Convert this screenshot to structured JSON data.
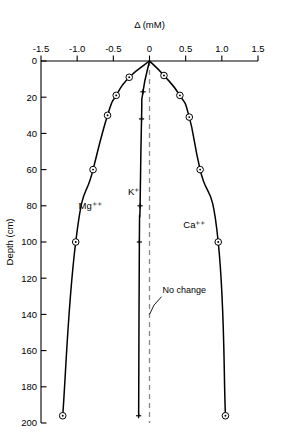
{
  "chart_data": {
    "type": "line",
    "title": "",
    "xlabel": "Δ (mM)",
    "ylabel": "Depth (cm)",
    "xlim": [
      -1.5,
      1.5
    ],
    "ylim": [
      0,
      200
    ],
    "y_inverted": true,
    "grid": false,
    "legend_position": "inline-annotations",
    "x_ticks": [
      -1.5,
      -1.0,
      -0.5,
      0,
      0.5,
      1.0,
      1.5
    ],
    "x_tick_labels": [
      "-1.5",
      "-1.0",
      "-0.5",
      "0",
      "0.5",
      "1.0",
      "1.5"
    ],
    "y_ticks": [
      0,
      20,
      40,
      60,
      80,
      100,
      120,
      140,
      160,
      180,
      200
    ],
    "y_tick_labels": [
      "0",
      "20",
      "40",
      "60",
      "80",
      "100",
      "120",
      "140",
      "160",
      "180",
      "200"
    ],
    "annotations": [
      {
        "text": "No change",
        "x": 0.18,
        "y": 128,
        "points_to_x": 0.0,
        "points_to_y": 140
      }
    ],
    "reference_line": {
      "name": "no-change-line",
      "x": 0,
      "style": "dashed",
      "color": "#888888"
    },
    "series": [
      {
        "name": "Mg++",
        "label": "Mg⁺⁺",
        "marker": "circle-dot",
        "color": "#000000",
        "label_x": -0.82,
        "label_y": 82,
        "points": [
          {
            "x": 0.0,
            "y": 0
          },
          {
            "x": -0.28,
            "y": 9
          },
          {
            "x": -0.46,
            "y": 19
          },
          {
            "x": -0.58,
            "y": 30
          },
          {
            "x": -0.78,
            "y": 60
          },
          {
            "x": -1.02,
            "y": 100
          },
          {
            "x": -1.2,
            "y": 196
          }
        ]
      },
      {
        "name": "K+",
        "label": "K⁺",
        "marker": "plus",
        "color": "#000000",
        "label_x": -0.22,
        "label_y": 74,
        "points": [
          {
            "x": 0.0,
            "y": 0
          },
          {
            "x": -0.09,
            "y": 17
          },
          {
            "x": -0.11,
            "y": 32
          },
          {
            "x": -0.13,
            "y": 80
          },
          {
            "x": -0.14,
            "y": 100
          },
          {
            "x": -0.15,
            "y": 196
          }
        ]
      },
      {
        "name": "Ca++",
        "label": "Ca⁺⁺",
        "marker": "circle-dot",
        "color": "#000000",
        "label_x": 0.62,
        "label_y": 92,
        "points": [
          {
            "x": 0.0,
            "y": 0
          },
          {
            "x": 0.2,
            "y": 8
          },
          {
            "x": 0.42,
            "y": 19
          },
          {
            "x": 0.55,
            "y": 31
          },
          {
            "x": 0.7,
            "y": 60
          },
          {
            "x": 0.95,
            "y": 100
          },
          {
            "x": 1.05,
            "y": 196
          }
        ]
      }
    ]
  },
  "axes": {
    "x_axis_title": "Δ (mM)",
    "y_axis_title": "Depth (cm)"
  }
}
